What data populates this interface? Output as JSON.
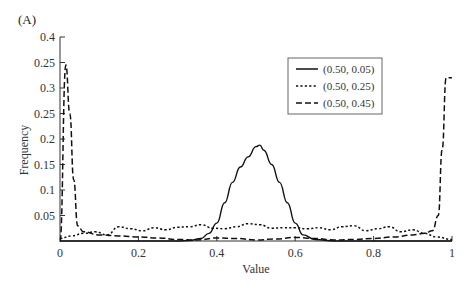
{
  "panel_label": "(A)",
  "chart_data": {
    "type": "line",
    "title": "",
    "xlabel": "Value",
    "ylabel": "Frequency",
    "xlim": [
      0,
      1
    ],
    "ylim": [
      0,
      0.4
    ],
    "x_ticks": [
      0,
      0.2,
      0.4,
      0.6,
      0.8,
      1
    ],
    "x_tick_labels": [
      "0",
      "0.2",
      "0.4",
      "0.6",
      "0.8",
      "1"
    ],
    "y_ticks": [
      0.05,
      0.1,
      0.15,
      0.2,
      0.25,
      0.3,
      0.35,
      0.4
    ],
    "y_tick_labels": [
      "0.05",
      "0.1",
      "0.15",
      "0.2",
      "0.25",
      "0.3",
      "0.25",
      "0.4"
    ],
    "grid": false,
    "legend_position": "upper right",
    "series": [
      {
        "name": "(0.50, 0.05)",
        "style": "solid",
        "x": [
          0.0,
          0.05,
          0.1,
          0.15,
          0.2,
          0.25,
          0.3,
          0.33,
          0.36,
          0.38,
          0.4,
          0.42,
          0.44,
          0.46,
          0.48,
          0.5,
          0.51,
          0.52,
          0.54,
          0.56,
          0.58,
          0.6,
          0.62,
          0.65,
          0.7,
          0.8,
          0.9,
          1.0
        ],
        "values": [
          0.0,
          0.0,
          0.0,
          0.0,
          0.0,
          0.0,
          0.0,
          0.001,
          0.005,
          0.015,
          0.035,
          0.075,
          0.115,
          0.145,
          0.165,
          0.185,
          0.188,
          0.178,
          0.15,
          0.115,
          0.075,
          0.035,
          0.012,
          0.003,
          0.0,
          0.0,
          0.0,
          0.0
        ]
      },
      {
        "name": "(0.50, 0.25)",
        "style": "dotted",
        "x": [
          0.0,
          0.03,
          0.06,
          0.09,
          0.12,
          0.15,
          0.18,
          0.21,
          0.24,
          0.27,
          0.3,
          0.33,
          0.36,
          0.39,
          0.42,
          0.45,
          0.48,
          0.51,
          0.54,
          0.57,
          0.6,
          0.63,
          0.66,
          0.69,
          0.72,
          0.75,
          0.78,
          0.81,
          0.84,
          0.87,
          0.9,
          0.93,
          0.96,
          1.0
        ],
        "values": [
          0.005,
          0.01,
          0.015,
          0.018,
          0.012,
          0.028,
          0.024,
          0.02,
          0.026,
          0.022,
          0.027,
          0.028,
          0.032,
          0.025,
          0.024,
          0.028,
          0.034,
          0.032,
          0.025,
          0.026,
          0.026,
          0.024,
          0.026,
          0.022,
          0.028,
          0.03,
          0.02,
          0.024,
          0.028,
          0.018,
          0.022,
          0.015,
          0.008,
          0.003
        ]
      },
      {
        "name": "(0.50, 0.45)",
        "style": "dashed",
        "x": [
          0.0,
          0.015,
          0.025,
          0.035,
          0.045,
          0.06,
          0.1,
          0.15,
          0.2,
          0.25,
          0.3,
          0.35,
          0.4,
          0.45,
          0.5,
          0.55,
          0.6,
          0.65,
          0.7,
          0.75,
          0.8,
          0.85,
          0.9,
          0.93,
          0.95,
          0.965,
          0.975,
          0.985,
          1.0
        ],
        "values": [
          0.0,
          0.345,
          0.25,
          0.12,
          0.03,
          0.018,
          0.012,
          0.01,
          0.008,
          0.006,
          0.003,
          0.002,
          0.006,
          0.005,
          0.002,
          0.004,
          0.007,
          0.005,
          0.002,
          0.003,
          0.005,
          0.008,
          0.012,
          0.015,
          0.02,
          0.05,
          0.18,
          0.32,
          0.32
        ]
      }
    ]
  }
}
